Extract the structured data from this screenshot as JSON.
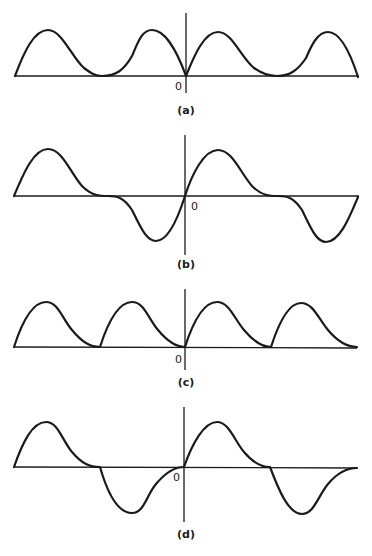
{
  "figure": {
    "panels": [
      {
        "id": "a",
        "caption": "(a)",
        "origin_label": "0",
        "description": "Periodic full-rectified skewed humps, non-negative",
        "baseline_y": 76,
        "axis": {
          "x": 186,
          "top": 13,
          "bottom": 93
        },
        "hline": {
          "x1": 15,
          "x2": 359
        },
        "origin_pos": {
          "x": 175,
          "y": 90
        },
        "caption_pos": {
          "x": 186,
          "y": 114
        },
        "path": "M15,76 C24,52 34,30 48,30 C62,30 72,58 84,68 C92,74 96,76 102,76 C116,76 124,70 132,56 C138,42 142,30 152,30 C164,30 176,48 186,76 C194,56 204,32 218,32 C232,32 240,56 254,68 C262,74 268,76 277,76 C290,76 298,70 306,58 C312,44 318,32 328,32 C340,32 350,52 358,77"
      },
      {
        "id": "b",
        "caption": "(b)",
        "origin_label": "0",
        "description": "Odd-symmetric wave: positive skewed hump then inverted mirrored hump",
        "baseline_y": 196,
        "axis": {
          "x": 185,
          "top": 135,
          "bottom": 255
        },
        "hline": {
          "x1": 14,
          "x2": 359
        },
        "origin_pos": {
          "x": 191,
          "y": 210
        },
        "caption_pos": {
          "x": 186,
          "y": 268
        },
        "path": "M14,196 C24,172 34,149 48,149 C62,149 70,172 82,186 C92,196 100,196 108,196 C118,196 124,198 132,210 C140,226 146,241 156,241 C168,241 178,218 185,196 C192,174 204,150 218,150 C232,150 240,172 252,186 C262,196 270,196 278,196 C288,196 294,198 302,210 C310,226 316,242 326,242 C340,242 350,216 358,197"
      },
      {
        "id": "c",
        "caption": "(c)",
        "origin_label": "0",
        "description": "Sequence of identical skewed positive pulses each decaying to zero",
        "baseline_y": 347,
        "axis": {
          "x": 185,
          "top": 289,
          "bottom": 370
        },
        "hline": {
          "x1": 14,
          "x2": 357
        },
        "origin_pos": {
          "x": 175,
          "y": 363
        },
        "caption_pos": {
          "x": 186,
          "y": 386
        },
        "path": "M14,347 C22,322 32,302 46,302 C58,302 62,318 72,330 C82,342 90,347 100,347 C108,322 118,302 132,302 C144,302 148,318 158,330 C168,342 176,347 185,347 C193,322 204,302 217,302 C229,302 234,318 244,330 C254,342 262,347 271,347 C279,322 289,303 301,303 C313,303 318,318 328,330 C338,342 348,347 357,347"
      },
      {
        "id": "d",
        "caption": "(d)",
        "origin_label": "0",
        "description": "Alternating positive and negative skewed pulses",
        "baseline_y": 467,
        "axis": {
          "x": 184,
          "top": 407,
          "bottom": 522
        },
        "hline": {
          "x1": 14,
          "x2": 357
        },
        "origin_pos": {
          "x": 173,
          "y": 481
        },
        "caption_pos": {
          "x": 186,
          "y": 538
        },
        "path": "M14,467 C22,444 32,422 46,422 C58,422 62,440 72,452 C82,464 90,467 100,467 C106,488 116,513 132,513 C144,513 146,496 156,484 C166,472 176,467 184,467 C192,444 204,422 217,422 C229,422 234,440 244,452 C254,464 262,467 270,467 C278,488 288,514 302,514 C314,514 318,496 328,484 C338,472 348,468 357,468"
      }
    ]
  }
}
